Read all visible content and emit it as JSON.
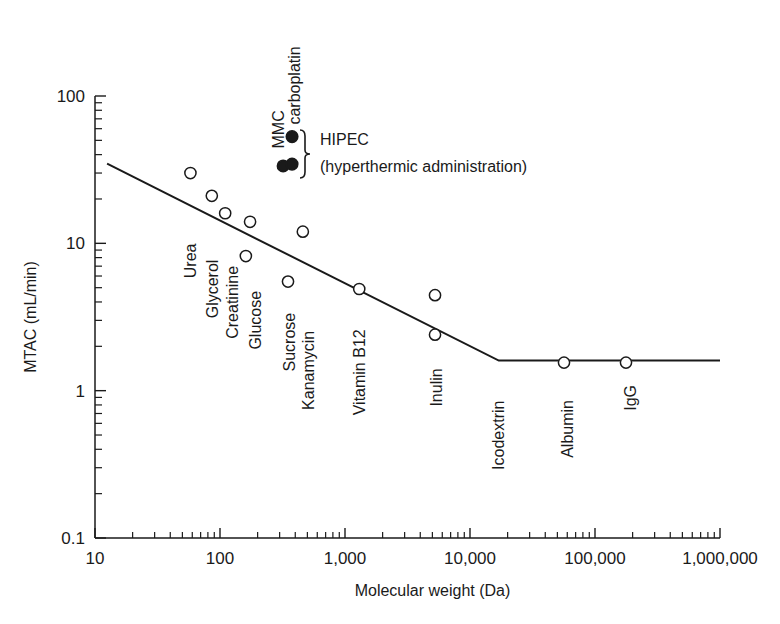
{
  "chart_data": {
    "type": "scatter",
    "title": "",
    "xlabel": "Molecular weight (Da)",
    "ylabel": "MTAC (mL/min)",
    "xscale": "log",
    "yscale": "log",
    "xlim": [
      10,
      1000000
    ],
    "ylim": [
      0.1,
      100
    ],
    "grid": false,
    "x_ticks": [
      {
        "value": 10,
        "label": "10"
      },
      {
        "value": 100,
        "label": "100"
      },
      {
        "value": 1000,
        "label": "1,000"
      },
      {
        "value": 10000,
        "label": "10,000"
      },
      {
        "value": 100000,
        "label": "100,000"
      },
      {
        "value": 1000000,
        "label": "1,000,000"
      }
    ],
    "y_ticks": [
      {
        "value": 0.1,
        "label": "0.1"
      },
      {
        "value": 1,
        "label": "1"
      },
      {
        "value": 10,
        "label": "10"
      },
      {
        "value": 100,
        "label": "100"
      }
    ],
    "series": [
      {
        "name": "Solutes (conventional)",
        "marker": "open-circle",
        "points": [
          {
            "label": "Urea",
            "x": 58,
            "y": 30
          },
          {
            "label": "Glycerol",
            "x": 86,
            "y": 21
          },
          {
            "label": "Creatinine",
            "x": 110,
            "y": 16
          },
          {
            "label": "Glucose",
            "x": 174,
            "y": 14
          },
          {
            "label": "",
            "x": 161,
            "y": 8.2
          },
          {
            "label": "Sucrose",
            "x": 350,
            "y": 5.5
          },
          {
            "label": "Kanamycin",
            "x": 460,
            "y": 12
          },
          {
            "label": "Vitamin B12",
            "x": 1300,
            "y": 4.9
          },
          {
            "label": "",
            "x": 5250,
            "y": 4.45
          },
          {
            "label": "Inulin",
            "x": 5250,
            "y": 2.4
          },
          {
            "label": "Albumin",
            "x": 56500,
            "y": 1.55
          },
          {
            "label": "IgG",
            "x": 177000,
            "y": 1.55
          }
        ]
      },
      {
        "name": "HIPEC (hyperthermic administration)",
        "marker": "filled-circle",
        "points": [
          {
            "label": "carboplatin",
            "x": 377,
            "y": 53
          },
          {
            "label": "MMC",
            "x": 320,
            "y": 33.5
          },
          {
            "label": "",
            "x": 377,
            "y": 34.5
          }
        ]
      },
      {
        "name": "Trend line",
        "type": "line",
        "points": [
          {
            "x": 12.5,
            "y": 34.7
          },
          {
            "x": 17000,
            "y": 1.6
          },
          {
            "x": 1000000,
            "y": 1.6
          }
        ]
      }
    ],
    "point_labels": [
      {
        "text": "Urea",
        "x": 58,
        "y_top": 11.5,
        "y_bottom": 5.8
      },
      {
        "text": "Glycerol",
        "x": 86,
        "y_top": 8.8,
        "y_bottom": 3.1
      },
      {
        "text": "Creatinine",
        "x": 125,
        "y_top": 8.8,
        "y_bottom": 2.25
      },
      {
        "text": "Glucose",
        "x": 190,
        "y_top": 5.5,
        "y_bottom": 1.9
      },
      {
        "text": "Sucrose",
        "x": 355,
        "y_top": 3.8,
        "y_bottom": 1.35
      },
      {
        "text": "Kanamycin",
        "x": 510,
        "y_top": 3.4,
        "y_bottom": 0.74
      },
      {
        "text": "Vitamin B12",
        "x": 1300,
        "y_top": 3.4,
        "y_bottom": 0.68
      },
      {
        "text": "Inulin",
        "x": 5300,
        "y_top": 1.95,
        "y_bottom": 0.78
      },
      {
        "text": "Icodextrin",
        "x": 16800,
        "y_top": 1.14,
        "y_bottom": 0.29
      },
      {
        "text": "Albumin",
        "x": 60000,
        "y_top": 1.16,
        "y_bottom": 0.35
      },
      {
        "text": "IgG",
        "x": 190000,
        "y_top": 1.16,
        "y_bottom": 0.73
      },
      {
        "text": "MMC",
        "x": 290,
        "y_top": 100,
        "y_bottom": 44
      },
      {
        "text": "carboplatin",
        "x": 390,
        "y_top": 160,
        "y_bottom": 64
      }
    ],
    "annotations": [
      {
        "text": "HIPEC",
        "x": 440,
        "y": 50
      },
      {
        "text": "(hyperthermic administration)",
        "x": 440,
        "y": 33
      }
    ]
  }
}
